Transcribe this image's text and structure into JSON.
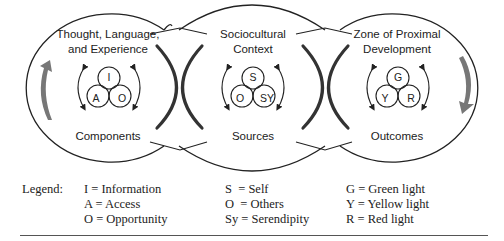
{
  "diagram": {
    "stages": [
      {
        "title_line1": "Thought, Language,",
        "title_line2": "and Experience",
        "circles": [
          "I",
          "A",
          "O"
        ],
        "footer": "Components"
      },
      {
        "title_line1": "Sociocultural",
        "title_line2": "Context",
        "circles": [
          "S",
          "O",
          "SY"
        ],
        "footer": "Sources"
      },
      {
        "title_line1": "Zone of Proximal",
        "title_line2": "Development",
        "circles": [
          "G",
          "Y",
          "R"
        ],
        "footer": "Outcomes"
      }
    ],
    "colors": {
      "outline": "#222222",
      "cycle_arrow": "#777777"
    }
  },
  "legend": {
    "title": "Legend:",
    "columns": [
      [
        "I = Information",
        "A = Access",
        "O = Opportunity"
      ],
      [
        "S  = Self",
        "O  = Others",
        "Sy = Serendipity"
      ],
      [
        "G = Green light",
        "Y = Yellow light",
        "R = Red light"
      ]
    ]
  }
}
